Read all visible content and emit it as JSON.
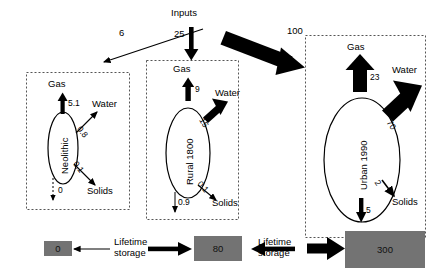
{
  "diagram": {
    "type": "flow-diagram",
    "inputs": {
      "label": "Inputs",
      "to_neolithic": "6",
      "to_rural": "25",
      "to_urban": "100"
    },
    "systems": [
      {
        "id": "neolithic",
        "name": "Neolithic",
        "gas_label": "Gas",
        "gas_value": "5.1",
        "water_label": "Water",
        "water_value": "0.8",
        "solids_label": "Solids",
        "solids_value": "0.1",
        "storage_flow_value": "0"
      },
      {
        "id": "rural",
        "name": "Rural 1800",
        "gas_label": "Gas",
        "gas_value": "9",
        "water_label": "Water",
        "water_value": "15",
        "solids_label": "Solids",
        "solids_value": "0.1",
        "storage_flow_value": "0.9"
      },
      {
        "id": "urban",
        "name": "Urban 1990",
        "gas_label": "Gas",
        "gas_value": "23",
        "water_label": "Water",
        "water_value": "70",
        "solids_label": "Solids",
        "solids_value": "2",
        "storage_flow_value": "5"
      }
    ],
    "storage": {
      "caption_left": "Lifetime storage",
      "caption_right": "Lifetime storage",
      "boxes": [
        {
          "id": "neolithic-storage",
          "value": "0"
        },
        {
          "id": "rural-storage",
          "value": "80"
        },
        {
          "id": "urban-storage",
          "value": "300"
        }
      ]
    },
    "colors": {
      "stroke": "#000000",
      "fill_arrow": "#000000",
      "storage_fill": "#737373",
      "background": "#ffffff",
      "dashed_border": "#555555"
    }
  }
}
